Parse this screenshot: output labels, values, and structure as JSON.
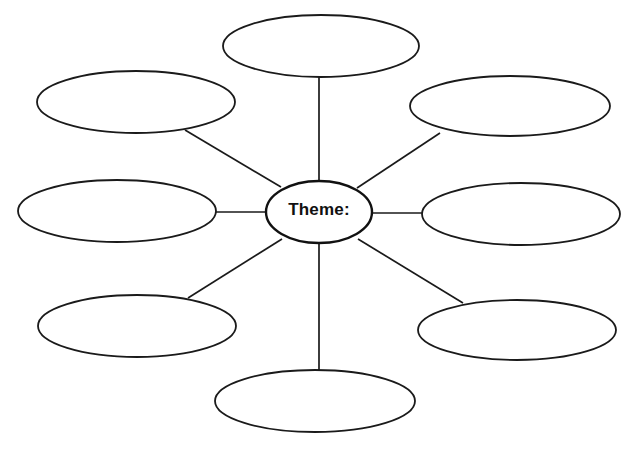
{
  "document": {
    "kind": "concept-map-worksheet",
    "title": "Theme Concept Map",
    "background_color": "#ffffff",
    "stroke_color": "#1a1a1a",
    "width": 633,
    "height": 451
  },
  "center": {
    "label": "Theme:",
    "cx": 319,
    "cy": 212,
    "rx": 53,
    "ry": 31,
    "text_x": 319,
    "text_y": 209
  },
  "bubbles": [
    {
      "name": "bubble-top",
      "label": "",
      "cx": 321,
      "cy": 46,
      "rx": 98,
      "ry": 31
    },
    {
      "name": "bubble-top-left",
      "label": "",
      "cx": 136,
      "cy": 102,
      "rx": 99,
      "ry": 31
    },
    {
      "name": "bubble-top-right",
      "label": "",
      "cx": 510,
      "cy": 106,
      "rx": 100,
      "ry": 30
    },
    {
      "name": "bubble-left",
      "label": "",
      "cx": 117,
      "cy": 211,
      "rx": 99,
      "ry": 31
    },
    {
      "name": "bubble-right",
      "label": "",
      "cx": 521,
      "cy": 214,
      "rx": 99,
      "ry": 31
    },
    {
      "name": "bubble-bottom-left",
      "label": "",
      "cx": 137,
      "cy": 326,
      "rx": 99,
      "ry": 31
    },
    {
      "name": "bubble-bottom-right",
      "label": "",
      "cx": 517,
      "cy": 330,
      "rx": 99,
      "ry": 30
    },
    {
      "name": "bubble-bottom",
      "label": "",
      "cx": 315,
      "cy": 401,
      "rx": 100,
      "ry": 31
    }
  ],
  "connectors": [
    {
      "name": "connector-top",
      "x1": 319,
      "y1": 181,
      "x2": 319,
      "y2": 77
    },
    {
      "name": "connector-top-left",
      "x1": 281,
      "y1": 187,
      "x2": 185,
      "y2": 130
    },
    {
      "name": "connector-top-right",
      "x1": 357,
      "y1": 188,
      "x2": 440,
      "y2": 133
    },
    {
      "name": "connector-left",
      "x1": 266,
      "y1": 212,
      "x2": 216,
      "y2": 212
    },
    {
      "name": "connector-right",
      "x1": 372,
      "y1": 213,
      "x2": 422,
      "y2": 213
    },
    {
      "name": "connector-bottom-left",
      "x1": 282,
      "y1": 239,
      "x2": 188,
      "y2": 298
    },
    {
      "name": "connector-bottom-right",
      "x1": 358,
      "y1": 239,
      "x2": 463,
      "y2": 303
    },
    {
      "name": "connector-bottom",
      "x1": 319,
      "y1": 243,
      "x2": 319,
      "y2": 371
    }
  ]
}
